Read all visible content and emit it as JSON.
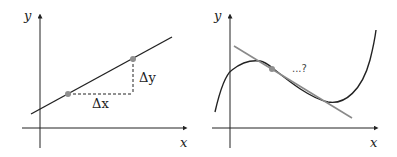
{
  "colors": {
    "axis": "#222222",
    "line": "#222222",
    "tangent": "#8a8a8a",
    "point": "#8f8f8f",
    "dashed": "#222222"
  },
  "left_panel": {
    "x_axis_label": "x",
    "y_axis_label": "y",
    "delta_x_label": "Δx",
    "delta_y_label": "Δy",
    "description": "straight line with two points showing rise over run"
  },
  "right_panel": {
    "x_axis_label": "x",
    "y_axis_label": "y",
    "annotation": "...?",
    "description": "cubic-like curve with a tangent line touching at one point"
  }
}
